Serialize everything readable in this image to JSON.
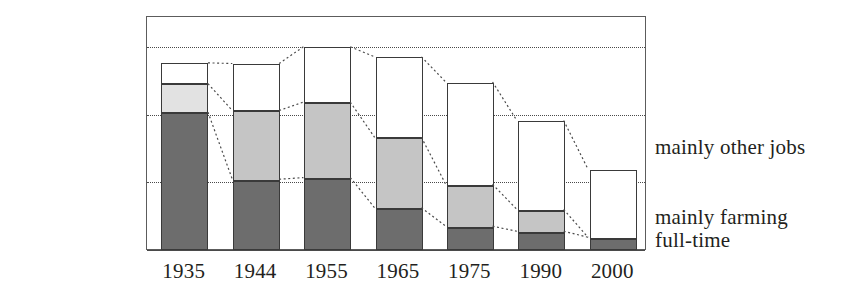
{
  "chart_data": {
    "type": "bar",
    "stacked": true,
    "title": "",
    "xlabel": "",
    "ylabel": "",
    "categories": [
      "1935",
      "1944",
      "1955",
      "1965",
      "1975",
      "1990",
      "2000"
    ],
    "ylim": [
      0,
      6600000
    ],
    "yticks": [
      0,
      2000000,
      4000000,
      6000000
    ],
    "ytick_labels": [
      "0",
      "2,000,000",
      "4,000,000",
      "6,000,000"
    ],
    "grid": "horizontal-dotted",
    "legend_position": "right",
    "series": [
      {
        "name": "mainly other jobs",
        "fill": "#ffffff",
        "values": [
          620000,
          1400000,
          1650000,
          2400000,
          3050000,
          2650000,
          2030000
        ]
      },
      {
        "name": "mainly farming",
        "fill": "#c5c5c5",
        "values": [
          850000,
          2050000,
          2250000,
          2100000,
          1250000,
          650000,
          0
        ]
      },
      {
        "name": "full-time",
        "fill": "#6d6d6d",
        "values": [
          4050000,
          2050000,
          2100000,
          1200000,
          650000,
          500000,
          320000
        ]
      }
    ],
    "totals": [
      5520000,
      5500000,
      6000000,
      5700000,
      4950000,
      3800000,
      2350000
    ],
    "connectors": "dotted lines link corresponding segment boundaries between adjacent bars",
    "annotations": []
  },
  "legend": {
    "lines": [
      {
        "text": "mainly other jobs",
        "top": 136
      },
      {
        "text": "mainly farming",
        "top": 206
      },
      {
        "text": "full-time",
        "top": 229
      }
    ]
  },
  "colors": {
    "fill_other_jobs": "#ffffff",
    "fill_mainly_farming": "#c5c5c5",
    "fill_mainly_farming_pale": "#e2e2e2",
    "fill_full_time": "#6d6d6d",
    "stroke": "#3a3a3a",
    "frame": "#5c5c5c",
    "grid": "#4a4a4a",
    "text": "#231f20",
    "background": "#ffffff"
  }
}
